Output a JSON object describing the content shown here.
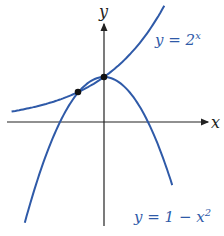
{
  "chart_data": {
    "type": "line",
    "title": "",
    "xlabel": "x",
    "ylabel": "y",
    "grid": false,
    "series": [
      {
        "name": "y = 2^x",
        "label_text": "y = 2",
        "label_sup": "x",
        "color": "#2f5aa8"
      },
      {
        "name": "y = 1 − x^2",
        "label_text": "y = 1 − x",
        "label_sup": "2",
        "color": "#2f5aa8"
      }
    ],
    "intersections": [
      {
        "x": -0.59,
        "y": 0.66
      },
      {
        "x": 0,
        "y": 1
      }
    ],
    "xlim": [
      -2.2,
      2.4
    ],
    "ylim": [
      -2.3,
      2.2
    ]
  }
}
